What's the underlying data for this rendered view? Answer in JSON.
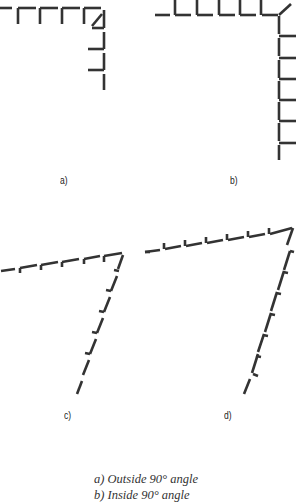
{
  "panels": [
    {
      "id": "a",
      "label": "a)"
    },
    {
      "id": "b",
      "label": "b)"
    },
    {
      "id": "c",
      "label": "c)"
    },
    {
      "id": "d",
      "label": "d)"
    }
  ],
  "captions": [
    "a) Outside 90° angle",
    "b) Inside 90° angle"
  ],
  "stroke_color": "#333333"
}
